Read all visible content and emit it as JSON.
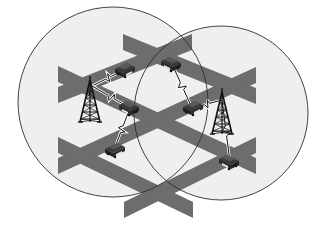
{
  "figure": {
    "background_color": "#ffffff"
  },
  "coverage_areas": [
    {
      "id": "cell-left",
      "label": "Left cell coverage",
      "fill": "#efefef",
      "stroke": "#2e2e2e"
    },
    {
      "id": "cell-right",
      "label": "Right cell coverage",
      "fill": "#efefef",
      "stroke": "#2e2e2e"
    }
  ],
  "roads": {
    "color": "#6d6d6d",
    "items": [
      {
        "id": "road-ur-a",
        "direction": "up-right"
      },
      {
        "id": "road-ur-b",
        "direction": "up-right"
      },
      {
        "id": "road-ur-c",
        "direction": "up-right"
      },
      {
        "id": "road-dr-a",
        "direction": "down-right"
      },
      {
        "id": "road-dr-b",
        "direction": "down-right"
      },
      {
        "id": "road-dr-c",
        "direction": "down-right"
      }
    ]
  },
  "towers": {
    "color": "#111111",
    "items": [
      {
        "id": "tower-left",
        "label": "Base station (left cell)"
      },
      {
        "id": "tower-right",
        "label": "Base station (right cell)"
      }
    ]
  },
  "vehicles": {
    "body_color": "#3a3a3a",
    "roof_color": "#5a5a5a",
    "plate_color": "#e6e6e6",
    "items": [
      {
        "id": "car-1"
      },
      {
        "id": "car-2"
      },
      {
        "id": "car-3"
      },
      {
        "id": "car-4"
      },
      {
        "id": "car-5"
      },
      {
        "id": "car-6"
      }
    ]
  },
  "links": {
    "color": "#111111",
    "items": [
      {
        "id": "link-1",
        "from": "tower-left",
        "to": "car-1"
      },
      {
        "id": "link-2",
        "from": "tower-left",
        "to": "car-3"
      },
      {
        "id": "link-3",
        "from": "car-3",
        "to": "car-5"
      },
      {
        "id": "link-4",
        "from": "car-2",
        "to": "car-4"
      },
      {
        "id": "link-5",
        "from": "car-4",
        "to": "tower-right"
      },
      {
        "id": "link-6",
        "from": "tower-right",
        "to": "car-6"
      }
    ]
  }
}
